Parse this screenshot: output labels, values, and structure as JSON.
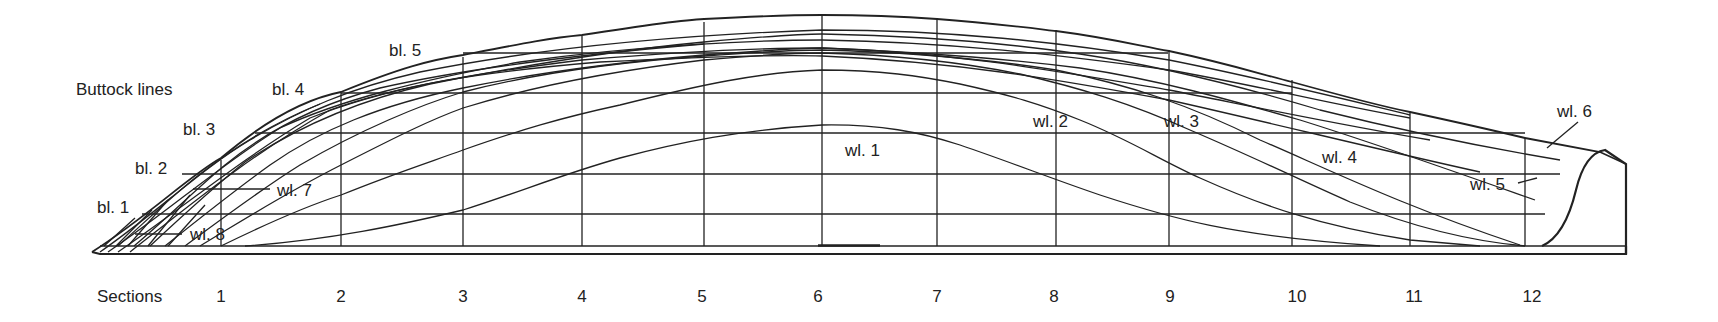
{
  "title": "Buttock lines",
  "sections_label": "Sections",
  "sections": [
    "1",
    "2",
    "3",
    "4",
    "5",
    "6",
    "7",
    "8",
    "9",
    "10",
    "11",
    "12"
  ],
  "buttock_labels": [
    "bl. 1",
    "bl. 2",
    "bl. 3",
    "bl. 4",
    "bl. 5"
  ],
  "waterline_labels": [
    "wl. 1",
    "wl. 2",
    "wl. 3",
    "wl. 4",
    "wl. 5",
    "wl. 6",
    "wl. 7",
    "wl. 8"
  ],
  "colors": {
    "line": "#222222",
    "background": "#ffffff"
  }
}
